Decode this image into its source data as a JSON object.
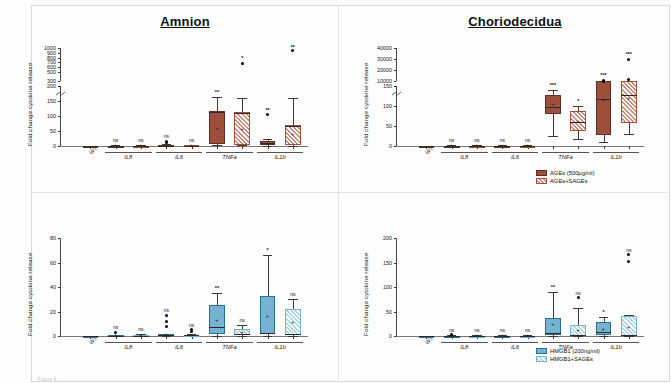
{
  "figure": {
    "background": "#ffffff",
    "colors": {
      "ages_solid": "#9d4f3b",
      "ages_hatch": "#c98a78",
      "hmgb1_solid": "#74b4d2",
      "hmgb1_hatch": "#a9d3e6",
      "axis": "#444444",
      "text": "#1a1a1a"
    },
    "caption": "Figure 4."
  },
  "panels": {
    "top_left": {
      "title": "Amnion",
      "ylabel": "Fold change cytokine release",
      "legend": [
        {
          "label": "AGEs (500µg/ml)",
          "style": "solidA"
        },
        {
          "label": "AGEs+SAGEs",
          "style": "hatchA"
        }
      ]
    },
    "top_right": {
      "title": "Choriodecidua",
      "ylabel": "Fold change cytokine release",
      "legend": [
        {
          "label": "AGEs (500µg/ml)",
          "style": "solidA"
        },
        {
          "label": "AGEs+SAGEs",
          "style": "hatchA"
        }
      ]
    },
    "bottom_left": {
      "title": "",
      "ylabel": "Fold change cytokine release",
      "legend": [
        {
          "label": "HMGB1 (200ng/ml)",
          "style": "solidB"
        },
        {
          "label": "HMGB1+SAGEs",
          "style": "hatchB"
        }
      ]
    },
    "bottom_right": {
      "title": "",
      "ylabel": "Fold change cytokine release",
      "legend": [
        {
          "label": "HMGB1 (200ng/ml)",
          "style": "solidB"
        },
        {
          "label": "HMGB1+SAGEs",
          "style": "hatchB"
        }
      ]
    }
  },
  "chart_data": [
    {
      "id": "top_left",
      "type": "box",
      "title": "Amnion",
      "xlabel": "",
      "ylabel": "Fold change cytokine release",
      "categories": [
        "WT",
        "IL8",
        "IL6",
        "TNFa",
        "IL1b"
      ],
      "tick_labels": [
        "0",
        "50",
        "100",
        "150",
        "200",
        "300",
        "500",
        "600",
        "700",
        "800",
        "900",
        "1000"
      ],
      "axis_break": true,
      "lower_range": [
        0,
        200
      ],
      "upper_range": [
        300,
        1000
      ],
      "series": [
        {
          "name": "AGEs (500µg/ml)",
          "style": "solidA",
          "boxes": [
            {
              "cat": "WT",
              "q1": 0,
              "median": 0,
              "q3": 0,
              "whisker_lo": 0,
              "whisker_hi": 0,
              "mean": 0,
              "sig": "",
              "outliers": []
            },
            {
              "cat": "IL8",
              "q1": 0,
              "median": 0,
              "q3": 1,
              "whisker_lo": 0,
              "whisker_hi": 2,
              "mean": 1,
              "sig": "ns",
              "outliers": []
            },
            {
              "cat": "IL6",
              "q1": 0,
              "median": 1,
              "q3": 4,
              "whisker_lo": 0,
              "whisker_hi": 6,
              "mean": 2,
              "sig": "ns",
              "outliers": [
                12,
                16
              ]
            },
            {
              "cat": "TNFa",
              "q1": 8,
              "median": 115,
              "q3": 118,
              "whisker_lo": 2,
              "whisker_hi": 165,
              "mean": 60,
              "sig": "**",
              "outliers": []
            },
            {
              "cat": "IL1b",
              "q1": 2,
              "median": 10,
              "q3": 16,
              "whisker_lo": 0,
              "whisker_hi": 22,
              "mean": 8,
              "sig": "**",
              "outliers": [
                105
              ]
            }
          ]
        },
        {
          "name": "AGEs+SAGEs",
          "style": "hatchA",
          "boxes": [
            {
              "cat": "IL8",
              "q1": 0,
              "median": 0,
              "q3": 1,
              "whisker_lo": 0,
              "whisker_hi": 2,
              "mean": 1,
              "sig": "ns",
              "outliers": []
            },
            {
              "cat": "IL6",
              "q1": 0,
              "median": 0,
              "q3": 2,
              "whisker_lo": 0,
              "whisker_hi": 4,
              "mean": 1,
              "sig": "ns",
              "outliers": []
            },
            {
              "cat": "TNFa",
              "q1": 4,
              "median": 112,
              "q3": 115,
              "whisker_lo": 2,
              "whisker_hi": 160,
              "mean": 55,
              "sig": "*",
              "outliers": [
                680
              ]
            },
            {
              "cat": "IL1b",
              "q1": 2,
              "median": 68,
              "q3": 72,
              "whisker_lo": 1,
              "whisker_hi": 160,
              "mean": 40,
              "sig": "**",
              "outliers": [
                950
              ]
            }
          ]
        }
      ]
    },
    {
      "id": "top_right",
      "type": "box",
      "title": "Choriodecidua",
      "xlabel": "",
      "ylabel": "Fold change cytokine release",
      "categories": [
        "WT",
        "IL8",
        "IL6",
        "TNFa",
        "IL1b"
      ],
      "tick_labels": [
        "0",
        "50",
        "100",
        "150",
        "10000",
        "20000",
        "30000",
        "40000"
      ],
      "axis_break": true,
      "lower_range": [
        0,
        150
      ],
      "upper_range": [
        10000,
        40000
      ],
      "series": [
        {
          "name": "AGEs (500µg/ml)",
          "style": "solidA",
          "boxes": [
            {
              "cat": "WT",
              "q1": 0,
              "median": 0,
              "q3": 0,
              "whisker_lo": 0,
              "whisker_hi": 0,
              "mean": 0,
              "sig": "",
              "outliers": []
            },
            {
              "cat": "IL8",
              "q1": 0,
              "median": 0,
              "q3": 1,
              "whisker_lo": 0,
              "whisker_hi": 2,
              "mean": 1,
              "sig": "ns",
              "outliers": []
            },
            {
              "cat": "IL6",
              "q1": 0,
              "median": 0,
              "q3": 1,
              "whisker_lo": 0,
              "whisker_hi": 2,
              "mean": 1,
              "sig": "ns",
              "outliers": []
            },
            {
              "cat": "TNFa",
              "q1": 80,
              "median": 97,
              "q3": 128,
              "whisker_lo": 25,
              "whisker_hi": 140,
              "mean": 105,
              "sig": "***",
              "outliers": []
            },
            {
              "cat": "IL1b",
              "q1": 28,
              "median": 118,
              "q3": 175,
              "whisker_lo": 10,
              "whisker_hi": 185,
              "mean": 115,
              "sig": "***",
              "outliers": [
                8000,
                11000
              ]
            }
          ]
        },
        {
          "name": "AGEs+SAGEs",
          "style": "hatchA",
          "boxes": [
            {
              "cat": "IL8",
              "q1": 0,
              "median": 0,
              "q3": 1,
              "whisker_lo": 0,
              "whisker_hi": 2,
              "mean": 1,
              "sig": "ns",
              "outliers": []
            },
            {
              "cat": "IL6",
              "q1": 0,
              "median": 0,
              "q3": 1,
              "whisker_lo": 0,
              "whisker_hi": 2,
              "mean": 1,
              "sig": "ns",
              "outliers": []
            },
            {
              "cat": "TNFa",
              "q1": 38,
              "median": 60,
              "q3": 88,
              "whisker_lo": 18,
              "whisker_hi": 100,
              "mean": 62,
              "sig": "*",
              "outliers": []
            },
            {
              "cat": "IL1b",
              "q1": 58,
              "median": 128,
              "q3": 175,
              "whisker_lo": 30,
              "whisker_hi": 182,
              "mean": 120,
              "sig": "***",
              "outliers": [
                11500,
                30000
              ]
            }
          ]
        }
      ]
    },
    {
      "id": "bottom_left",
      "type": "box",
      "title": "",
      "xlabel": "",
      "ylabel": "Fold change cytokine release",
      "categories": [
        "WT",
        "IL8",
        "IL6",
        "TNFa",
        "IL1b"
      ],
      "tick_labels": [
        "0",
        "20",
        "40",
        "60",
        "80"
      ],
      "axis_break": false,
      "lower_range": [
        0,
        80
      ],
      "series": [
        {
          "name": "HMGB1 (200ng/ml)",
          "style": "solidB",
          "boxes": [
            {
              "cat": "WT",
              "q1": 0,
              "median": 0,
              "q3": 0,
              "whisker_lo": 0,
              "whisker_hi": 0,
              "mean": 0,
              "sig": "",
              "outliers": []
            },
            {
              "cat": "IL8",
              "q1": 0,
              "median": 0,
              "q3": 1,
              "whisker_lo": 0,
              "whisker_hi": 1,
              "mean": 0.5,
              "sig": "ns",
              "outliers": [
                3
              ]
            },
            {
              "cat": "IL6",
              "q1": 0,
              "median": 0.5,
              "q3": 1.5,
              "whisker_lo": 0,
              "whisker_hi": 2,
              "mean": 1,
              "sig": "ns",
              "outliers": [
                8,
                12,
                17
              ]
            },
            {
              "cat": "TNFa",
              "q1": 2,
              "median": 7,
              "q3": 25,
              "whisker_lo": 0,
              "whisker_hi": 35,
              "mean": 13,
              "sig": "**",
              "outliers": []
            },
            {
              "cat": "IL1b",
              "q1": 2,
              "median": 2.5,
              "q3": 33,
              "whisker_lo": 0,
              "whisker_hi": 66,
              "mean": 16,
              "sig": "*",
              "outliers": []
            }
          ]
        },
        {
          "name": "HMGB1+SAGEs",
          "style": "hatchB",
          "boxes": [
            {
              "cat": "IL8",
              "q1": 0,
              "median": 0,
              "q3": 0.8,
              "whisker_lo": 0,
              "whisker_hi": 1.5,
              "mean": 0.5,
              "sig": "ns",
              "outliers": []
            },
            {
              "cat": "IL6",
              "q1": 0,
              "median": 0.5,
              "q3": 1.2,
              "whisker_lo": 0,
              "whisker_hi": 2,
              "mean": 0.8,
              "sig": "ns",
              "outliers": [
                4,
                5
              ]
            },
            {
              "cat": "TNFa",
              "q1": 1,
              "median": 2,
              "q3": 5.5,
              "whisker_lo": 0,
              "whisker_hi": 9,
              "mean": 3,
              "sig": "ns",
              "outliers": []
            },
            {
              "cat": "IL1b",
              "q1": 1,
              "median": 2,
              "q3": 22,
              "whisker_lo": 0,
              "whisker_hi": 30,
              "mean": 11,
              "sig": "ns",
              "outliers": []
            }
          ]
        }
      ]
    },
    {
      "id": "bottom_right",
      "type": "box",
      "title": "",
      "xlabel": "",
      "ylabel": "Fold change cytokine release",
      "categories": [
        "WT",
        "IL8",
        "IL6",
        "TNFa",
        "IL1b"
      ],
      "tick_labels": [
        "0",
        "50",
        "100",
        "150",
        "200"
      ],
      "axis_break": false,
      "lower_range": [
        0,
        200
      ],
      "series": [
        {
          "name": "HMGB1 (200ng/ml)",
          "style": "solidB",
          "boxes": [
            {
              "cat": "WT",
              "q1": 0,
              "median": 0,
              "q3": 0,
              "whisker_lo": 0,
              "whisker_hi": 0,
              "mean": 0,
              "sig": "",
              "outliers": []
            },
            {
              "cat": "IL8",
              "q1": 0,
              "median": 0,
              "q3": 1,
              "whisker_lo": 0,
              "whisker_hi": 2,
              "mean": 1,
              "sig": "ns",
              "outliers": [
                3
              ]
            },
            {
              "cat": "IL6",
              "q1": 0,
              "median": 0,
              "q3": 1,
              "whisker_lo": 0,
              "whisker_hi": 2,
              "mean": 1,
              "sig": "ns",
              "outliers": []
            },
            {
              "cat": "TNFa",
              "q1": 2,
              "median": 7,
              "q3": 37,
              "whisker_lo": 0,
              "whisker_hi": 90,
              "mean": 23,
              "sig": "**",
              "outliers": []
            },
            {
              "cat": "IL1b",
              "q1": 2,
              "median": 8,
              "q3": 29,
              "whisker_lo": 0,
              "whisker_hi": 38,
              "mean": 14,
              "sig": "*",
              "outliers": []
            }
          ]
        },
        {
          "name": "HMGB1+SAGEs",
          "style": "hatchB",
          "boxes": [
            {
              "cat": "IL8",
              "q1": 0,
              "median": 0,
              "q3": 0.8,
              "whisker_lo": 0,
              "whisker_hi": 1.5,
              "mean": 0.5,
              "sig": "ns",
              "outliers": []
            },
            {
              "cat": "IL6",
              "q1": 0,
              "median": 0,
              "q3": 0.8,
              "whisker_lo": 0,
              "whisker_hi": 1.5,
              "mean": 0.5,
              "sig": "ns",
              "outliers": []
            },
            {
              "cat": "TNFa",
              "q1": 1,
              "median": 3,
              "q3": 22,
              "whisker_lo": 0,
              "whisker_hi": 58,
              "mean": 12,
              "sig": "ns",
              "outliers": [
                78
              ]
            },
            {
              "cat": "IL1b",
              "q1": 1,
              "median": 2,
              "q3": 40,
              "whisker_lo": 0,
              "whisker_hi": 42,
              "mean": 18,
              "sig": "ns",
              "outliers": [
                152,
                166
              ]
            }
          ]
        }
      ]
    }
  ]
}
